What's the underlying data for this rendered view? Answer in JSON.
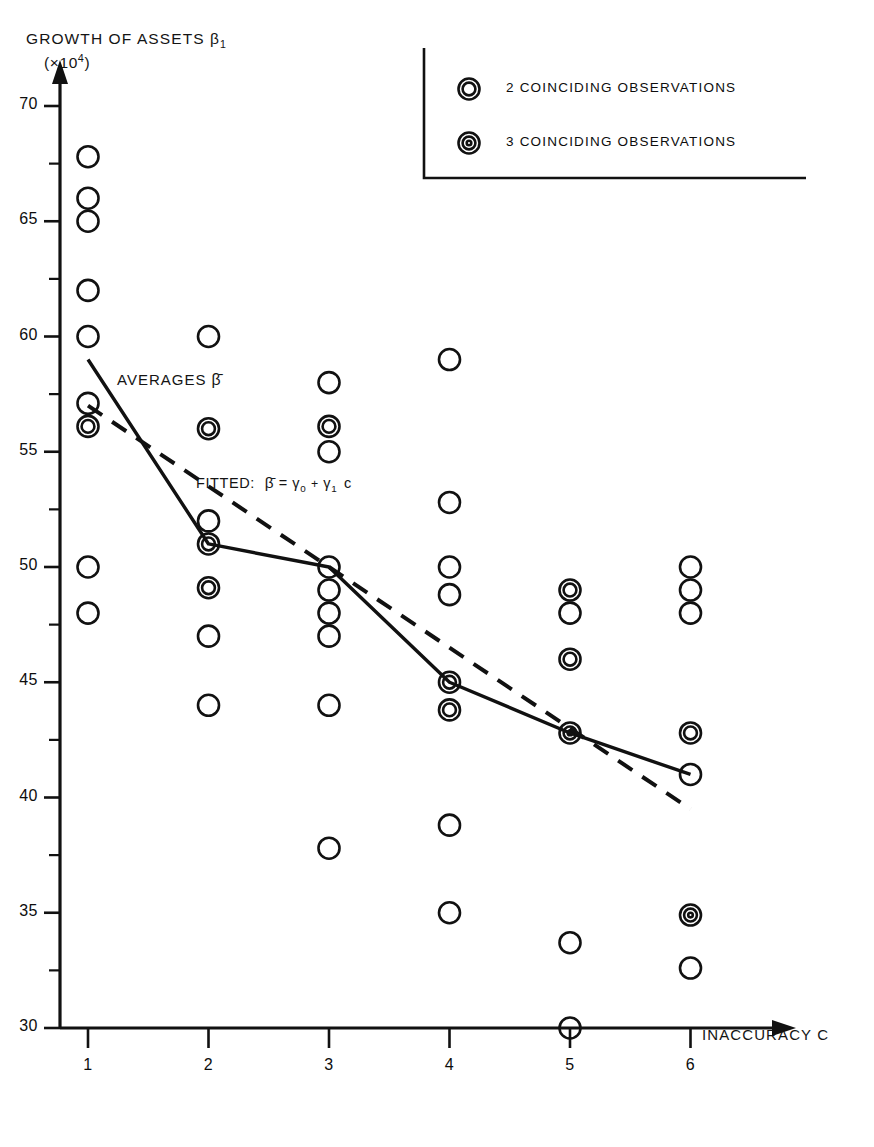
{
  "chart_data": {
    "type": "scatter",
    "title": "",
    "xlabel": "INACCURACY C",
    "ylabel": "GROWTH OF ASSETS β₁",
    "ylabel_unit": "(×10⁴)",
    "xlim": [
      0.4,
      6.8
    ],
    "ylim": [
      29,
      71
    ],
    "grid": false,
    "x_ticks": [
      1,
      2,
      3,
      4,
      5,
      6
    ],
    "x_tick_labels": [
      "1",
      "2",
      "3",
      "4",
      "5",
      "6"
    ],
    "y_ticks": [
      30,
      35,
      40,
      45,
      50,
      55,
      60,
      65,
      70
    ],
    "y_tick_labels": [
      "30",
      "35",
      "40",
      "45",
      "50",
      "55",
      "60",
      "65",
      "70"
    ],
    "y_minor_ticks": [
      32.5,
      37.5,
      42.5,
      47.5,
      52.5,
      57.5,
      62.5,
      67.5
    ],
    "marker": "open-circle",
    "points": [
      {
        "x": 1,
        "y": 67.8,
        "count": 1
      },
      {
        "x": 1,
        "y": 66.0,
        "count": 1
      },
      {
        "x": 1,
        "y": 65.0,
        "count": 1
      },
      {
        "x": 1,
        "y": 62.0,
        "count": 1
      },
      {
        "x": 1,
        "y": 60.0,
        "count": 1
      },
      {
        "x": 1,
        "y": 57.1,
        "count": 1
      },
      {
        "x": 1,
        "y": 56.1,
        "count": 2
      },
      {
        "x": 1,
        "y": 50.0,
        "count": 1
      },
      {
        "x": 1,
        "y": 48.0,
        "count": 1
      },
      {
        "x": 2,
        "y": 60.0,
        "count": 1
      },
      {
        "x": 2,
        "y": 56.0,
        "count": 2
      },
      {
        "x": 2,
        "y": 52.0,
        "count": 1
      },
      {
        "x": 2,
        "y": 51.0,
        "count": 2
      },
      {
        "x": 2,
        "y": 49.1,
        "count": 2
      },
      {
        "x": 2,
        "y": 47.0,
        "count": 1
      },
      {
        "x": 2,
        "y": 44.0,
        "count": 1
      },
      {
        "x": 3,
        "y": 58.0,
        "count": 1
      },
      {
        "x": 3,
        "y": 56.1,
        "count": 2
      },
      {
        "x": 3,
        "y": 55.0,
        "count": 1
      },
      {
        "x": 3,
        "y": 50.0,
        "count": 1
      },
      {
        "x": 3,
        "y": 49.0,
        "count": 1
      },
      {
        "x": 3,
        "y": 48.0,
        "count": 1
      },
      {
        "x": 3,
        "y": 47.0,
        "count": 1
      },
      {
        "x": 3,
        "y": 44.0,
        "count": 1
      },
      {
        "x": 3,
        "y": 37.8,
        "count": 1
      },
      {
        "x": 4,
        "y": 59.0,
        "count": 1
      },
      {
        "x": 4,
        "y": 52.8,
        "count": 1
      },
      {
        "x": 4,
        "y": 50.0,
        "count": 1
      },
      {
        "x": 4,
        "y": 48.8,
        "count": 1
      },
      {
        "x": 4,
        "y": 45.0,
        "count": 2
      },
      {
        "x": 4,
        "y": 43.8,
        "count": 2
      },
      {
        "x": 4,
        "y": 38.8,
        "count": 1
      },
      {
        "x": 4,
        "y": 35.0,
        "count": 1
      },
      {
        "x": 5,
        "y": 49.0,
        "count": 2
      },
      {
        "x": 5,
        "y": 48.0,
        "count": 1
      },
      {
        "x": 5,
        "y": 46.0,
        "count": 2
      },
      {
        "x": 5,
        "y": 42.8,
        "count": 3
      },
      {
        "x": 5,
        "y": 33.7,
        "count": 1
      },
      {
        "x": 5,
        "y": 30.0,
        "count": 1
      },
      {
        "x": 6,
        "y": 50.0,
        "count": 1
      },
      {
        "x": 6,
        "y": 49.0,
        "count": 1
      },
      {
        "x": 6,
        "y": 48.0,
        "count": 1
      },
      {
        "x": 6,
        "y": 42.8,
        "count": 2
      },
      {
        "x": 6,
        "y": 41.0,
        "count": 1
      },
      {
        "x": 6,
        "y": 34.9,
        "count": 3
      },
      {
        "x": 6,
        "y": 32.6,
        "count": 1
      }
    ],
    "series": [
      {
        "name": "AVERAGES β̄",
        "style": "solid",
        "x": [
          1,
          2,
          3,
          4,
          5,
          6
        ],
        "values": [
          59.0,
          51.0,
          50.0,
          45.0,
          42.8,
          41.0
        ]
      },
      {
        "name": "FITTED: β̄ = γ₀ + γ₁ c",
        "style": "dashed",
        "x": [
          1,
          6
        ],
        "values": [
          57.0,
          39.5
        ]
      }
    ]
  },
  "axes": {
    "y_title": "GROWTH OF ASSETS",
    "y_title_symbol": "β",
    "y_title_sub": "1",
    "y_unit": "(×10",
    "y_unit_sup": "4",
    "y_unit_close": ")",
    "x_title": "INACCURACY C"
  },
  "annotations": {
    "averages": "AVERAGES",
    "averages_symbol": "β̄",
    "fitted_prefix": "FITTED:",
    "fitted_formula_lhs": "β̄",
    "fitted_eq": "=",
    "fitted_g0": "γ",
    "fitted_g0_sub": "0",
    "fitted_plus": "+",
    "fitted_g1": "γ",
    "fitted_g1_sub": "1",
    "fitted_c": "c"
  },
  "legend": {
    "items": [
      {
        "label": "2 COINCIDING OBSERVATIONS",
        "rings": 2
      },
      {
        "label": "3 COINCIDING OBSERVATIONS",
        "rings": 3
      }
    ]
  },
  "colors": {
    "ink": "#111111",
    "background": "#ffffff"
  }
}
